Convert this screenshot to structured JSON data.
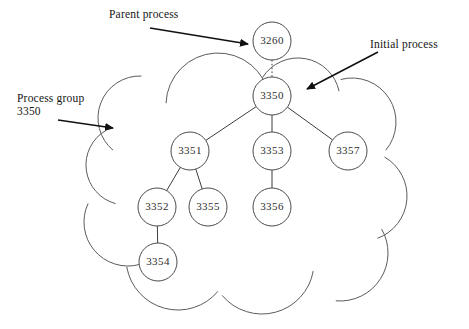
{
  "diagram": {
    "colors": {
      "background": "#ffffff",
      "node_stroke": "#4a4a4a",
      "node_fill": "#ffffff",
      "node_text": "#2e2e2e",
      "edge": "#3d3d3d",
      "cloud_stroke": "#5b5b5b",
      "annotation_text": "#141414",
      "annotation_arrow": "#111111"
    },
    "annotations": [
      {
        "id": "parent-process",
        "label": "Parent process",
        "label2": "",
        "arrow_from": [
          150,
          28
        ],
        "arrow_to": [
          248,
          44
        ]
      },
      {
        "id": "initial-process",
        "label": "Initial process",
        "label2": "",
        "arrow_from": [
          378,
          52
        ],
        "arrow_to": [
          307,
          89
        ]
      },
      {
        "id": "process-group",
        "label": "Process group",
        "label2": "3350",
        "arrow_from": [
          58,
          120
        ],
        "arrow_to": [
          113,
          128
        ]
      }
    ],
    "nodes": [
      {
        "id": "3260",
        "label": "3260",
        "cx": 272,
        "cy": 41,
        "r": 19,
        "inside_group": false
      },
      {
        "id": "3350",
        "label": "3350",
        "cx": 272,
        "cy": 96,
        "r": 19,
        "inside_group": true
      },
      {
        "id": "3351",
        "label": "3351",
        "cx": 190,
        "cy": 151,
        "r": 19,
        "inside_group": true
      },
      {
        "id": "3353",
        "label": "3353",
        "cx": 272,
        "cy": 151,
        "r": 19,
        "inside_group": true
      },
      {
        "id": "3357",
        "label": "3357",
        "cx": 348,
        "cy": 151,
        "r": 19,
        "inside_group": true
      },
      {
        "id": "3352",
        "label": "3352",
        "cx": 157,
        "cy": 207,
        "r": 19,
        "inside_group": true
      },
      {
        "id": "3355",
        "label": "3355",
        "cx": 208,
        "cy": 207,
        "r": 19,
        "inside_group": true
      },
      {
        "id": "3356",
        "label": "3356",
        "cx": 272,
        "cy": 207,
        "r": 19,
        "inside_group": true
      },
      {
        "id": "3354",
        "label": "3354",
        "cx": 158,
        "cy": 262,
        "r": 19,
        "inside_group": true
      }
    ],
    "edges": [
      {
        "from": "3260",
        "to": "3350",
        "style": "dotted"
      },
      {
        "from": "3350",
        "to": "3351",
        "style": "solid"
      },
      {
        "from": "3350",
        "to": "3353",
        "style": "solid"
      },
      {
        "from": "3350",
        "to": "3357",
        "style": "solid"
      },
      {
        "from": "3351",
        "to": "3352",
        "style": "solid"
      },
      {
        "from": "3351",
        "to": "3355",
        "style": "solid"
      },
      {
        "from": "3353",
        "to": "3356",
        "style": "solid"
      },
      {
        "from": "3352",
        "to": "3354",
        "style": "solid"
      }
    ],
    "group_boundary": {
      "shape": "cloud",
      "label_ref": "process-group",
      "bumps": [
        {
          "cx": 218,
          "cy": 105,
          "r": 52,
          "a0": 182,
          "a1": 352
        },
        {
          "cx": 298,
          "cy": 100,
          "r": 42,
          "a0": 212,
          "a1": 348
        },
        {
          "cx": 352,
          "cy": 122,
          "r": 44,
          "a0": 255,
          "a1": 40
        },
        {
          "cx": 362,
          "cy": 196,
          "r": 45,
          "a0": 300,
          "a1": 70
        },
        {
          "cx": 340,
          "cy": 253,
          "r": 48,
          "a0": 330,
          "a1": 95
        },
        {
          "cx": 262,
          "cy": 262,
          "r": 52,
          "a0": 10,
          "a1": 140
        },
        {
          "cx": 178,
          "cy": 258,
          "r": 52,
          "a0": 40,
          "a1": 170
        },
        {
          "cx": 128,
          "cy": 222,
          "r": 44,
          "a0": 75,
          "a1": 205
        },
        {
          "cx": 126,
          "cy": 165,
          "r": 40,
          "a0": 105,
          "a1": 240
        },
        {
          "cx": 140,
          "cy": 118,
          "r": 42,
          "a0": 130,
          "a1": 272
        }
      ]
    }
  }
}
